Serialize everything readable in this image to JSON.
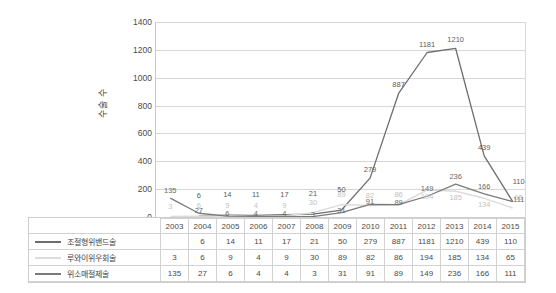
{
  "chart_data": {
    "type": "line",
    "title": "",
    "xlabel": "",
    "ylabel": "수술 수",
    "ylim": [
      0,
      1400
    ],
    "yticks": [
      1400,
      1200,
      1000,
      800,
      600,
      400,
      200,
      0
    ],
    "grid": true,
    "legend_position": "table-bottom-left",
    "categories": [
      "2003",
      "2004",
      "2005",
      "2006",
      "2007",
      "2008",
      "2009",
      "2010",
      "2011",
      "2012",
      "2013",
      "2014",
      "2015"
    ],
    "series": [
      {
        "name": "조절형위밴드술",
        "color": "#6e6e6e",
        "values": [
          null,
          6,
          14,
          11,
          17,
          21,
          50,
          279,
          887,
          1181,
          1210,
          439,
          110
        ],
        "display": [
          "",
          "6",
          "14",
          "11",
          "17",
          "21",
          "50",
          "279",
          "887",
          "1181",
          "1210",
          "439",
          "110"
        ]
      },
      {
        "name": "루와이위우회술",
        "color": "#dcdcdc",
        "values": [
          3,
          6,
          9,
          4,
          9,
          30,
          89,
          82,
          86,
          194,
          185,
          134,
          65
        ],
        "display": [
          "3",
          "6",
          "9",
          "4",
          "9",
          "30",
          "89",
          "82",
          "86",
          "194",
          "185",
          "134",
          "65"
        ]
      },
      {
        "name": "위소매절제술",
        "color": "#7a7a7a",
        "values": [
          135,
          27,
          6,
          4,
          4,
          3,
          31,
          91,
          89,
          149,
          236,
          166,
          111
        ],
        "display": [
          "135",
          "27",
          "6",
          "4",
          "4",
          "3",
          "31",
          "91",
          "89",
          "149",
          "236",
          "166",
          "111"
        ]
      }
    ]
  },
  "colors": {
    "series1": "#6e6e6e",
    "series2": "#dcdcdc",
    "series3": "#7a7a7a",
    "grid": "#d6d6d6",
    "axis": "#b4b4b4",
    "text": "#4a4a4a"
  }
}
